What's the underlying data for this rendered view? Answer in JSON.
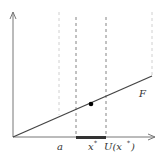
{
  "diagram": {
    "labels": {
      "a": "a",
      "x_star": "x",
      "x_star_sup": "*",
      "neighborhood": "U(x",
      "neighborhood_sup": "*",
      "neighborhood_close": ")",
      "curve": "F"
    },
    "colors": {
      "axis": "#777777",
      "line": "#444444",
      "dashed_dark": "#666666",
      "dashed_light": "#bbbbbb",
      "segment": "#333333",
      "point": "#000000"
    }
  }
}
